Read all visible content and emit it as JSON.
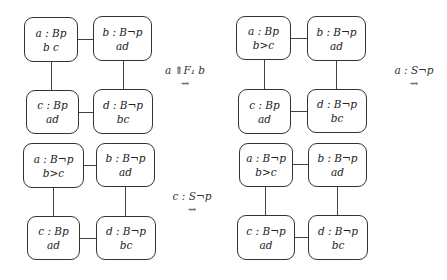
{
  "panels": [
    {
      "id": "top-left",
      "nodes": {
        "a": {
          "label": "a : Bp",
          "order": "b c"
        },
        "b": {
          "label": "b : B¬p",
          "order": "ad"
        },
        "c": {
          "label": "c : Bp",
          "order": "ad"
        },
        "d": {
          "label": "d : B¬p",
          "order": "bc"
        }
      }
    },
    {
      "id": "top-right",
      "nodes": {
        "a": {
          "label": "a : Bp",
          "order": "b>c"
        },
        "b": {
          "label": "b : B¬p",
          "order": "ad"
        },
        "c": {
          "label": "c : Bp",
          "order": "ad"
        },
        "d": {
          "label": "d : B¬p",
          "order": "bc"
        }
      }
    },
    {
      "id": "bottom-left",
      "nodes": {
        "a": {
          "label": "a : B¬p",
          "order": "b>c"
        },
        "b": {
          "label": "b : B¬p",
          "order": "ad"
        },
        "c": {
          "label": "c : Bp",
          "order": "ad"
        },
        "d": {
          "label": "d : B¬p",
          "order": "bc"
        }
      }
    },
    {
      "id": "bottom-right",
      "nodes": {
        "a": {
          "label": "a : B¬p",
          "order": "b>c"
        },
        "b": {
          "label": "b : B¬p",
          "order": "ad"
        },
        "c": {
          "label": "c : B¬p",
          "order": "ad"
        },
        "d": {
          "label": "d : B¬p",
          "order": "bc"
        }
      }
    }
  ],
  "transitions": [
    {
      "label": "a ⇑F₁ b",
      "arrow": "⇝"
    },
    {
      "label": "a : S¬p",
      "arrow": "⇝"
    },
    {
      "label": "c : S¬p",
      "arrow": "⇝"
    }
  ]
}
